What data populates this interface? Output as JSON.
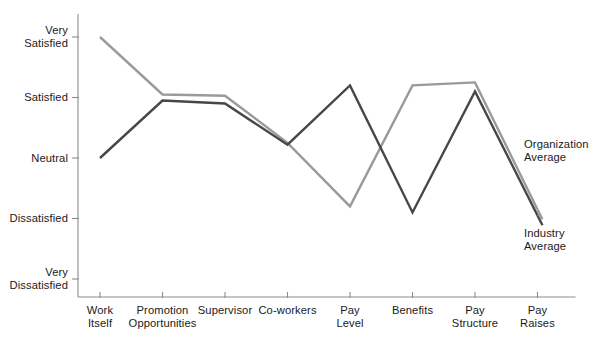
{
  "chart_data": {
    "type": "line",
    "title": "",
    "subtitle": "",
    "xlabel": "",
    "ylabel": "",
    "grid": false,
    "legend_position": "inline-right",
    "categories": [
      "Work\nItself",
      "Promotion\nOpportunities",
      "Supervisor",
      "Co-workers",
      "Pay\nLevel",
      "Benefits",
      "Pay\nStructure",
      "Pay\nRaises"
    ],
    "y_tick_labels": [
      "Very\nSatisfied",
      "Satisfied",
      "Neutral",
      "Dissatisfied",
      "Very\nDissatisfied"
    ],
    "y_tick_values": [
      5,
      4,
      3,
      2,
      1
    ],
    "ylim": [
      1,
      5
    ],
    "series": [
      {
        "name": "Organization\nAverage",
        "color": "#9a9a9a",
        "values": [
          5.0,
          4.05,
          4.03,
          3.25,
          2.2,
          4.2,
          4.25,
          2.15
        ]
      },
      {
        "name": "Industry\nAverage",
        "color": "#474747",
        "values": [
          3.0,
          3.95,
          3.9,
          3.22,
          4.2,
          2.1,
          4.1,
          2.05
        ]
      }
    ]
  },
  "axis": {
    "line_color": "#8c8c8c",
    "tick_color": "#8c8c8c"
  },
  "footnote": {
    "text": ""
  }
}
